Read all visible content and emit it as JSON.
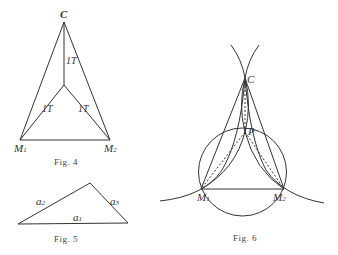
{
  "figures": [
    {
      "caption": "Fig. 4",
      "labels": {
        "apex": "C",
        "left": "M",
        "left_sub": "1",
        "right": "M",
        "right_sub": "2",
        "upper_segment": "1T",
        "left_segment": "1T",
        "right_segment": "1T"
      }
    },
    {
      "caption": "Fig. 5",
      "labels": {
        "left_side": "a",
        "left_side_sub": "2",
        "right_side": "a",
        "right_side_sub": "3",
        "base": "a",
        "base_sub": "1"
      }
    },
    {
      "caption": "Fig. 6",
      "labels": {
        "apex": "C",
        "inner_point": "P",
        "left": "M",
        "left_sub": "1",
        "right": "M",
        "right_sub": "2"
      }
    }
  ],
  "colors": {
    "line": "#333333",
    "background": "#ffffff"
  }
}
